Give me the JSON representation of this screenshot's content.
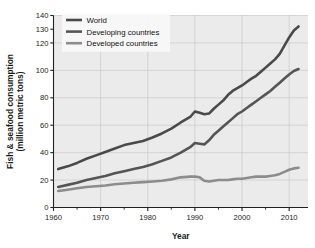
{
  "chart_data": {
    "type": "line",
    "title": "",
    "xlabel": "Year",
    "ylabel": "Fish & seafood consumption (million metric tons)",
    "ylabel_line1": "Fish & seafood consumption",
    "ylabel_line2": "(million metric tons)",
    "xlim": [
      1960,
      2014
    ],
    "ylim": [
      0,
      140
    ],
    "xticks": [
      1960,
      1970,
      1980,
      1990,
      2000,
      2010
    ],
    "xtick_labels": [
      "1960",
      "1970",
      "1980",
      "1990",
      "2000",
      "2010"
    ],
    "xminor_ticks": [
      1965,
      1975,
      1985,
      1995,
      2005
    ],
    "yticks": [
      0,
      20,
      40,
      60,
      80,
      100,
      120,
      130,
      140
    ],
    "ytick_labels": [
      "0",
      "20",
      "40",
      "60",
      "80",
      "100",
      "120",
      "130",
      "140"
    ],
    "grid": true,
    "legend_position": "top-left",
    "series": [
      {
        "name": "World",
        "color": "#4a4a4a",
        "x": [
          1961,
          1963,
          1965,
          1967,
          1969,
          1971,
          1973,
          1975,
          1977,
          1979,
          1981,
          1983,
          1985,
          1987,
          1989,
          1990,
          1991,
          1992,
          1993,
          1994,
          1995,
          1996,
          1997,
          1998,
          1999,
          2000,
          2001,
          2002,
          2003,
          2004,
          2005,
          2006,
          2007,
          2008,
          2009,
          2010,
          2011,
          2012
        ],
        "y": [
          28,
          30,
          32.5,
          35.5,
          38,
          40.5,
          43,
          45.5,
          47,
          48.5,
          51,
          54,
          57.5,
          62,
          66,
          70,
          69,
          68,
          68.5,
          72,
          75,
          78,
          82,
          85,
          87,
          89,
          91.5,
          94,
          96,
          99,
          102,
          105,
          108,
          112,
          118,
          124,
          129,
          132
        ]
      },
      {
        "name": "Developing countries",
        "color": "#555555",
        "x": [
          1961,
          1963,
          1965,
          1967,
          1969,
          1971,
          1973,
          1975,
          1977,
          1979,
          1981,
          1983,
          1985,
          1987,
          1989,
          1990,
          1991,
          1992,
          1993,
          1994,
          1995,
          1996,
          1997,
          1998,
          1999,
          2000,
          2001,
          2002,
          2003,
          2004,
          2005,
          2006,
          2007,
          2008,
          2009,
          2010,
          2011,
          2012
        ],
        "y": [
          15,
          16.5,
          18,
          20,
          21.5,
          23,
          25,
          26.5,
          28,
          29.5,
          31.5,
          34,
          36.5,
          40,
          44,
          47,
          46.5,
          46,
          49,
          53,
          56,
          59,
          62,
          65,
          68,
          70,
          72.5,
          75,
          77.5,
          80,
          82.5,
          85,
          88,
          91,
          94,
          97,
          99.5,
          101
        ]
      },
      {
        "name": "Developed countries",
        "color": "#8c8c8c",
        "x": [
          1961,
          1963,
          1965,
          1967,
          1969,
          1971,
          1973,
          1975,
          1977,
          1979,
          1981,
          1983,
          1985,
          1987,
          1989,
          1990,
          1991,
          1992,
          1993,
          1994,
          1995,
          1996,
          1997,
          1998,
          1999,
          2000,
          2001,
          2002,
          2003,
          2004,
          2005,
          2006,
          2007,
          2008,
          2009,
          2010,
          2011,
          2012
        ],
        "y": [
          12,
          13,
          14,
          15,
          15.5,
          16,
          17,
          17.5,
          18,
          18.5,
          19,
          19.5,
          20.5,
          22,
          22.5,
          22.5,
          22,
          19.5,
          19,
          19.5,
          20,
          20,
          20,
          20.5,
          21,
          21,
          21.5,
          22,
          22.5,
          22.5,
          22.5,
          23,
          23.5,
          24.5,
          26,
          27.5,
          28.5,
          29
        ]
      }
    ]
  },
  "legend": {
    "items": [
      {
        "label": "World",
        "color": "#4a4a4a"
      },
      {
        "label": "Developing countries",
        "color": "#555555"
      },
      {
        "label": "Developed countries",
        "color": "#8c8c8c"
      }
    ]
  },
  "style": {
    "plot_background": "#ebebeb",
    "grid_color": "#c9c9c9",
    "axis_color": "#222222",
    "legend_background": "#f7f7f7"
  }
}
